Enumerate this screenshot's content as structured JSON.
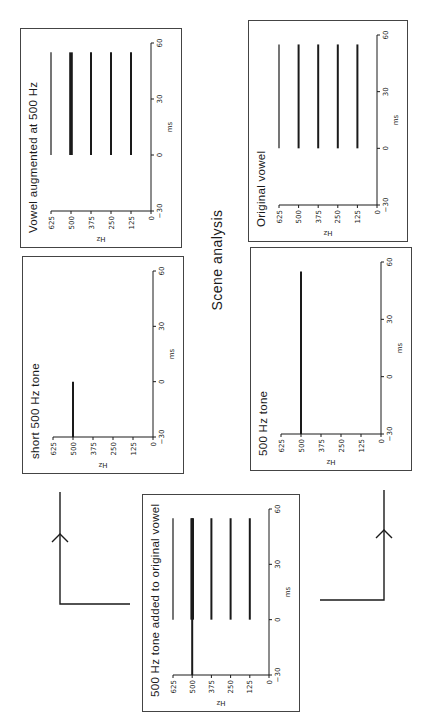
{
  "figure": {
    "center_label": "Scene analysis",
    "colors": {
      "ink": "#1a1a1a",
      "border": "#444444",
      "background": "#ffffff"
    }
  },
  "axes": {
    "x_label": "ms",
    "y_label": "Hz",
    "x_ticks": [
      "-30",
      "0",
      "30",
      "60"
    ],
    "y_ticks": [
      "0",
      "125",
      "250",
      "375",
      "500",
      "625"
    ]
  },
  "panels": [
    {
      "id": "vowel-augmented",
      "title": "Vowel augmented at 500 Hz"
    },
    {
      "id": "original-vowel",
      "title": "Original vowel"
    },
    {
      "id": "short-tone",
      "title": "short 500 Hz tone"
    },
    {
      "id": "tone",
      "title": "500 Hz tone"
    },
    {
      "id": "tone-added",
      "title": "500 Hz tone added to original vowel"
    }
  ],
  "chart_data": [
    {
      "type": "line",
      "title": "Vowel augmented at 500 Hz",
      "xlabel": "ms",
      "ylabel": "Hz",
      "xlim": [
        -30,
        60
      ],
      "ylim": [
        0,
        625
      ],
      "series": [
        {
          "name": "125 Hz",
          "x": [
            0,
            55
          ],
          "y": [
            125,
            125
          ],
          "weight": "normal"
        },
        {
          "name": "250 Hz",
          "x": [
            0,
            55
          ],
          "y": [
            250,
            250
          ],
          "weight": "normal"
        },
        {
          "name": "375 Hz",
          "x": [
            0,
            55
          ],
          "y": [
            375,
            375
          ],
          "weight": "normal"
        },
        {
          "name": "500 Hz",
          "x": [
            0,
            55
          ],
          "y": [
            500,
            500
          ],
          "weight": "heavy"
        },
        {
          "name": "625 Hz",
          "x": [
            0,
            55
          ],
          "y": [
            625,
            625
          ],
          "weight": "light"
        }
      ]
    },
    {
      "type": "line",
      "title": "Original vowel",
      "xlabel": "ms",
      "ylabel": "Hz",
      "xlim": [
        -30,
        60
      ],
      "ylim": [
        0,
        625
      ],
      "series": [
        {
          "name": "125 Hz",
          "x": [
            0,
            55
          ],
          "y": [
            125,
            125
          ],
          "weight": "normal"
        },
        {
          "name": "250 Hz",
          "x": [
            0,
            55
          ],
          "y": [
            250,
            250
          ],
          "weight": "normal"
        },
        {
          "name": "375 Hz",
          "x": [
            0,
            55
          ],
          "y": [
            375,
            375
          ],
          "weight": "normal"
        },
        {
          "name": "500 Hz",
          "x": [
            0,
            55
          ],
          "y": [
            500,
            500
          ],
          "weight": "normal"
        },
        {
          "name": "625 Hz",
          "x": [
            0,
            55
          ],
          "y": [
            625,
            625
          ],
          "weight": "light"
        }
      ]
    },
    {
      "type": "line",
      "title": "short 500 Hz tone",
      "xlabel": "ms",
      "ylabel": "Hz",
      "xlim": [
        -30,
        60
      ],
      "ylim": [
        0,
        625
      ],
      "series": [
        {
          "name": "500 Hz",
          "x": [
            -30,
            0
          ],
          "y": [
            500,
            500
          ],
          "weight": "normal"
        }
      ]
    },
    {
      "type": "line",
      "title": "500 Hz tone",
      "xlabel": "ms",
      "ylabel": "Hz",
      "xlim": [
        -30,
        60
      ],
      "ylim": [
        0,
        625
      ],
      "series": [
        {
          "name": "500 Hz",
          "x": [
            -30,
            55
          ],
          "y": [
            500,
            500
          ],
          "weight": "normal"
        }
      ]
    },
    {
      "type": "line",
      "title": "500 Hz tone added to original vowel",
      "xlabel": "ms",
      "ylabel": "Hz",
      "xlim": [
        -30,
        60
      ],
      "ylim": [
        0,
        625
      ],
      "series": [
        {
          "name": "125 Hz",
          "x": [
            0,
            55
          ],
          "y": [
            125,
            125
          ],
          "weight": "normal"
        },
        {
          "name": "250 Hz",
          "x": [
            0,
            55
          ],
          "y": [
            250,
            250
          ],
          "weight": "normal"
        },
        {
          "name": "375 Hz",
          "x": [
            0,
            55
          ],
          "y": [
            375,
            375
          ],
          "weight": "normal"
        },
        {
          "name": "500 Hz tone",
          "x": [
            -30,
            55
          ],
          "y": [
            500,
            500
          ],
          "weight": "normal"
        },
        {
          "name": "500 Hz vowel",
          "x": [
            0,
            55
          ],
          "y": [
            500,
            500
          ],
          "weight": "heavy"
        },
        {
          "name": "625 Hz",
          "x": [
            0,
            55
          ],
          "y": [
            625,
            625
          ],
          "weight": "light"
        }
      ]
    }
  ]
}
